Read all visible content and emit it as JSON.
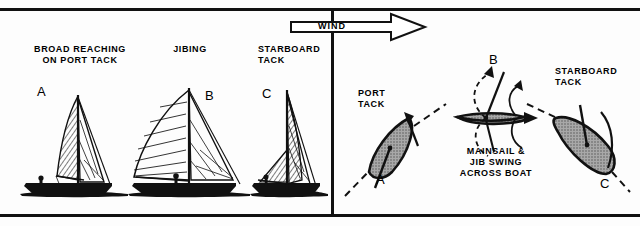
{
  "figure": {
    "title_text_left_panel": "Side views of a sailboat jibing",
    "background_color": "#fdfdfd",
    "ink_color": "#111111",
    "hull_fill_color": "#9a9a9a"
  },
  "left_panel": {
    "captions": [
      {
        "id": "broad-reaching",
        "text": "BROAD REACHING\nON PORT TACK",
        "x": 20,
        "y": 44,
        "width": 120
      },
      {
        "id": "jibing",
        "text": "JIBING",
        "x": 145,
        "y": 44,
        "width": 90
      },
      {
        "id": "starboard-tack",
        "text": "STARBOARD\nTACK",
        "x": 258,
        "y": 44,
        "width": 70
      }
    ],
    "boats": [
      {
        "label": "A",
        "label_x": 37,
        "label_y": 88,
        "caption_ref": "broad-reaching"
      },
      {
        "label": "B",
        "label_x": 205,
        "label_y": 92,
        "caption_ref": "jibing"
      },
      {
        "label": "C",
        "label_x": 262,
        "label_y": 90,
        "caption_ref": "starboard-tack"
      }
    ]
  },
  "wind_arrow": {
    "label": "WIND",
    "label_x": 330,
    "label_y": 22,
    "direction": "right",
    "x": 291,
    "y": 16,
    "width": 134,
    "height": 22
  },
  "right_panel": {
    "captions": [
      {
        "id": "port-tack",
        "text": "PORT\nTACK",
        "x": 358,
        "y": 88,
        "width": 46
      },
      {
        "id": "mainsail-jib-swing",
        "text": "MAINSAIL &\nJIB SWING\nACROSS BOAT",
        "x": 441,
        "y": 146,
        "width": 108
      },
      {
        "id": "starboard-tack-right",
        "text": "STARBOARD\nTACK",
        "x": 555,
        "y": 66,
        "width": 76
      }
    ],
    "boats": [
      {
        "label": "A",
        "label_x": 376,
        "label_y": 178,
        "position": "port-tack-leg"
      },
      {
        "label": "B",
        "label_x": 489,
        "label_y": 58,
        "position": "head-to-wind-jibe-point"
      },
      {
        "label": "C",
        "label_x": 600,
        "label_y": 180,
        "position": "starboard-tack-leg"
      }
    ]
  }
}
